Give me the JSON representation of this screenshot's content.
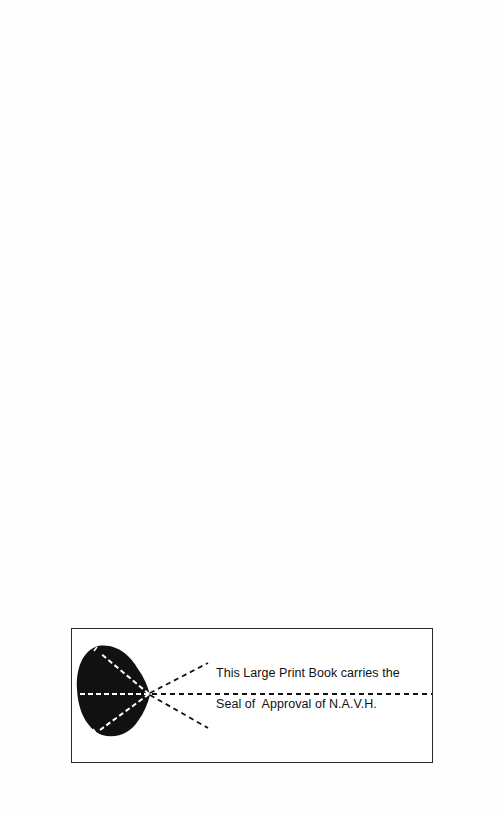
{
  "seal": {
    "line1": "This Large Print Book carries the",
    "line2": "Seal of  Approval of N.A.V.H.",
    "icon": "eye-seal-icon",
    "colors": {
      "ink": "#111111",
      "border": "#2a2a2a",
      "background": "#ffffff"
    }
  }
}
